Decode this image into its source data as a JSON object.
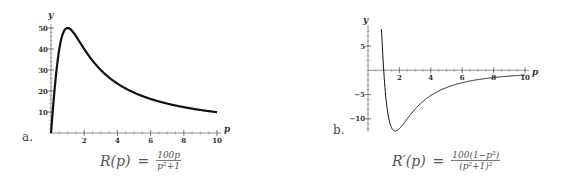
{
  "chart_data": [
    {
      "type": "line",
      "panel_label": "a.",
      "title": "",
      "xlabel": "p",
      "ylabel": "y",
      "function": "R(p) = 100p/(p^2+1)",
      "caption": {
        "lhs": "R(p)",
        "eq": "=",
        "num": "100p",
        "den": "p²+1"
      },
      "xlim": [
        0,
        10
      ],
      "ylim": [
        0,
        50
      ],
      "xticks": [
        2,
        4,
        6,
        8,
        10
      ],
      "yticks": [
        10,
        20,
        30,
        40,
        50
      ],
      "series": [
        {
          "name": "R(p)",
          "x": [
            0,
            0.25,
            0.5,
            0.75,
            1,
            1.5,
            2,
            2.5,
            3,
            4,
            5,
            6,
            7,
            8,
            9,
            10
          ],
          "y": [
            0,
            23.5,
            40,
            48,
            50,
            46.2,
            40,
            34.5,
            30,
            23.5,
            19.2,
            16.2,
            14,
            12.3,
            11,
            9.9
          ]
        }
      ]
    },
    {
      "type": "line",
      "panel_label": "b.",
      "title": "",
      "xlabel": "p",
      "ylabel": "y",
      "function": "R'(p) = 100(1-p^2)/(p^2+1)^2",
      "caption": {
        "lhs": "R′(p)",
        "eq": "=",
        "num": "100(1−p²)",
        "den": "(p²+1)²"
      },
      "xlim": [
        0,
        10
      ],
      "ylim": [
        -12.5,
        8.5
      ],
      "xticks": [
        2,
        4,
        6,
        8,
        10
      ],
      "yticks": [
        -10,
        -5,
        5
      ],
      "series": [
        {
          "name": "R'(p)",
          "x": [
            0.85,
            1,
            1.25,
            1.5,
            1.73,
            2,
            2.5,
            3,
            4,
            5,
            6,
            7,
            8,
            9,
            10
          ],
          "y": [
            8.4,
            0,
            -8.5,
            -11.8,
            -12.5,
            -12,
            -9.9,
            -8,
            -5.5,
            -3.6,
            -2.6,
            -1.9,
            -1.5,
            -1.2,
            -1
          ]
        }
      ]
    }
  ]
}
